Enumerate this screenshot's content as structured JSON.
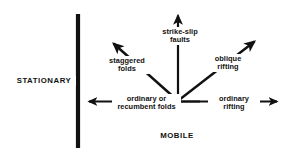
{
  "figure": {
    "background_color": "#ffffff",
    "ink_color": "#111111"
  },
  "boundary": {
    "name": "stationary-block-bar",
    "label": "STATIONARY",
    "x": 78,
    "y_top": 14,
    "y_bottom": 148,
    "thickness": 4.2
  },
  "mobile": {
    "label": "MOBILE"
  },
  "origin": {
    "x": 178,
    "y": 101.5,
    "baseline_x1": 158,
    "baseline_x2": 200
  },
  "vectors": [
    {
      "name": "ordinary-or-recumbent-folds",
      "label_lines": [
        "ordinary or",
        "recumbent folds"
      ],
      "direction": "left",
      "angle_deg": 180,
      "tip_x": 86,
      "tip_y": 101.5
    },
    {
      "name": "staggered-folds",
      "label_lines": [
        "staggered",
        "folds"
      ],
      "direction": "upper-left",
      "angle_deg": 135,
      "tip_x": 110,
      "tip_y": 40
    },
    {
      "name": "strike-slip-faults",
      "label_lines": [
        "strike-slip",
        "faults"
      ],
      "direction": "up",
      "angle_deg": 90,
      "tip_x": 178,
      "tip_y": 12
    },
    {
      "name": "oblique-rifting",
      "label_lines": [
        "oblique",
        "rifting"
      ],
      "direction": "upper-right",
      "angle_deg": 45,
      "tip_x": 258,
      "tip_y": 38
    },
    {
      "name": "ordinary-rifting",
      "label_lines": [
        "ordinary",
        "rifting"
      ],
      "direction": "right",
      "angle_deg": 0,
      "tip_x": 281,
      "tip_y": 101.5
    }
  ],
  "labels": {
    "strike_slip_line1": "strike-slip",
    "strike_slip_line2": "faults",
    "staggered_line1": "staggered",
    "staggered_line2": "folds",
    "oblique_line1": "oblique",
    "oblique_line2": "rifting",
    "ordinary_folds_line1": "ordinary or",
    "ordinary_folds_line2": "recumbent folds",
    "ordinary_rifting_line1": "ordinary",
    "ordinary_rifting_line2": "rifting",
    "stationary": "STATIONARY",
    "mobile": "MOBILE"
  }
}
